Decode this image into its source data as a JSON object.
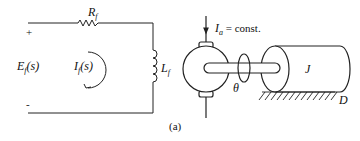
{
  "figure": {
    "caption": "(a)",
    "circuit": {
      "resistor_label": "R",
      "resistor_sub": "f",
      "inductor_label": "L",
      "inductor_sub": "f",
      "source_label_main": "E",
      "source_label_sub": "f",
      "source_label_arg": "(s)",
      "current_label_main": "I",
      "current_label_sub": "f",
      "current_label_arg": "(s)",
      "plus_sign": "+",
      "minus_sign": "-"
    },
    "motor": {
      "armature_current_main": "I",
      "armature_current_sub": "a",
      "armature_current_rest": " = const.",
      "angle_label": "θ",
      "inertia_label": "J",
      "damping_label": "D"
    }
  }
}
